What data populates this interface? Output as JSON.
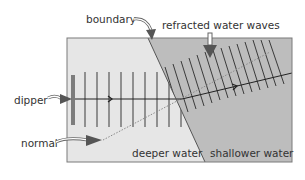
{
  "diagram": {
    "labels": {
      "boundary": "boundary",
      "refracted_waves": "refracted water waves",
      "dipper": "dipper",
      "normal": "normal",
      "deeper_water": "deeper water",
      "shallower_water": "shallower water"
    },
    "colors": {
      "deep_water": "#e6e6e6",
      "shallow_water": "#bdbdbd",
      "frame": "#7a7a7a",
      "wavefront": "#3a3a3a",
      "dipper": "#7d7d7d",
      "normal_line": "#8a8a8a",
      "arrow_fill": "#555555",
      "text": "#333333"
    },
    "icons": {
      "label_arrow": "curved-arrow-icon",
      "ray_direction": "chevron-right-icon"
    }
  }
}
